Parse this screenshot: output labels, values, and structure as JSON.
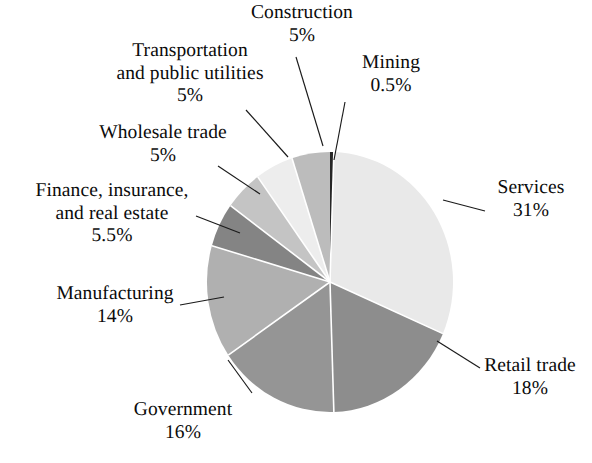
{
  "figure": {
    "background": "#ffffff",
    "text_color": "#0b0b0b"
  },
  "chart_data": {
    "type": "pie",
    "title": "",
    "subtitle": "",
    "xlabel": "",
    "ylabel": "",
    "legend_position": "none",
    "grid": false,
    "units": "percent",
    "total": 100,
    "start_angle_deg": 0,
    "direction": "clockwise",
    "categories": [
      "Mining",
      "Services",
      "Retail trade",
      "Government",
      "Manufacturing",
      "Finance, insurance, and real estate",
      "Wholesale trade",
      "Transportation and public utilities",
      "Construction"
    ],
    "values": [
      0.5,
      31,
      18,
      16,
      14,
      5.5,
      5,
      5,
      5
    ],
    "slices": [
      {
        "label": "Mining",
        "label_line1": "Mining",
        "label_line2": "",
        "value": 0.5,
        "value_text": "0.5%",
        "color": "#262626"
      },
      {
        "label": "Services",
        "label_line1": "Services",
        "label_line2": "",
        "value": 31,
        "value_text": "31%",
        "color": "#e9e9e9"
      },
      {
        "label": "Retail trade",
        "label_line1": "Retail trade",
        "label_line2": "",
        "value": 18,
        "value_text": "18%",
        "color": "#8d8d8d"
      },
      {
        "label": "Government",
        "label_line1": "Government",
        "label_line2": "",
        "value": 16,
        "value_text": "16%",
        "color": "#959595"
      },
      {
        "label": "Manufacturing",
        "label_line1": "Manufacturing",
        "label_line2": "",
        "value": 14,
        "value_text": "14%",
        "color": "#b0b0b0"
      },
      {
        "label": "Finance, insurance, and real estate",
        "label_line1": "Finance, insurance,",
        "label_line2": "and real estate",
        "value": 5.5,
        "value_text": "5.5%",
        "color": "#848484"
      },
      {
        "label": "Wholesale trade",
        "label_line1": "Wholesale trade",
        "label_line2": "",
        "value": 5,
        "value_text": "5%",
        "color": "#c4c4c4"
      },
      {
        "label": "Transportation and public utilities",
        "label_line1": "Transportation",
        "label_line2": "and public utilities",
        "value": 5,
        "value_text": "5%",
        "color": "#ededed"
      },
      {
        "label": "Construction",
        "label_line1": "Construction",
        "label_line2": "",
        "value": 5,
        "value_text": "5%",
        "color": "#bcbcbc"
      }
    ]
  }
}
